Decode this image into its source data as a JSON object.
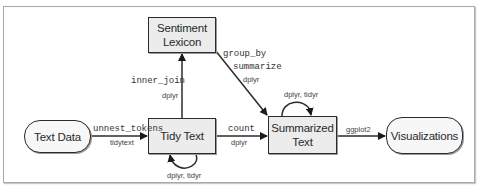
{
  "diagram": {
    "nodes": {
      "text_data": {
        "label": "Text Data",
        "shape": "rounded"
      },
      "tidy_text": {
        "label": "Tidy Text",
        "shape": "box"
      },
      "sentiment_lexicon": {
        "label_line1": "Sentiment",
        "label_line2": "Lexicon",
        "shape": "box"
      },
      "summarized_text": {
        "label_line1": "Summarized",
        "label_line2": "Text",
        "shape": "box"
      },
      "visualizations": {
        "label": "Visualizations",
        "shape": "rounded"
      }
    },
    "edges": {
      "text_to_tidy": {
        "function": "unnest_tokens",
        "package": "tidytext"
      },
      "tidy_to_lexicon": {
        "function": "inner_join",
        "package": "dplyr"
      },
      "lexicon_to_summarized": {
        "function1": "group_by",
        "function2": "summarize",
        "package": "dplyr"
      },
      "tidy_to_summarized": {
        "function": "count",
        "package": "dplyr"
      },
      "summarized_to_vis": {
        "package": "ggplot2"
      },
      "tidy_self_loop": {
        "package": "dplyr, tidyr"
      },
      "summarized_self_loop": {
        "package": "dplyr, tidyr"
      }
    },
    "colors": {
      "box_fill": "#ececec",
      "pill_fill": "#f7f7f7",
      "stroke": "#2b2b2b",
      "frame": "#a9a9a9"
    }
  }
}
